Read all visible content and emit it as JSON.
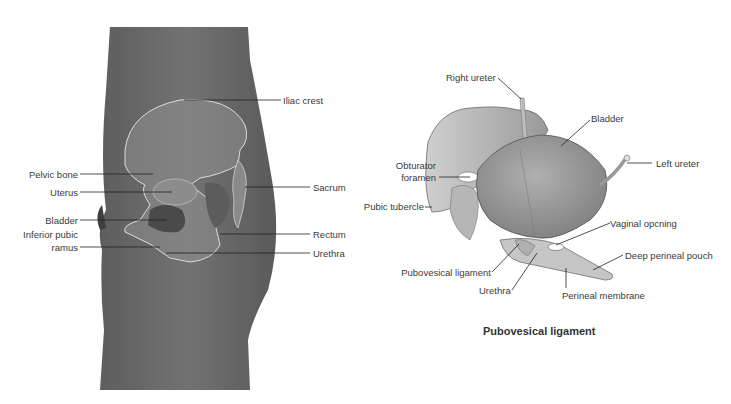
{
  "left_figure": {
    "labels": {
      "iliac_crest": "Iliac crest",
      "pelvic_bone": "Pelvic bone",
      "uterus": "Uterus",
      "sacrum": "Sacrum",
      "bladder": "Bladder",
      "inferior_pubic_ramus_1": "Inferior pubic",
      "inferior_pubic_ramus_2": "ramus",
      "rectum": "Rectum",
      "urethra": "Urethra"
    },
    "colors": {
      "body": "#6e6e6e",
      "bone_outline": "#d8d8d8",
      "bladder": "#4a4a4a"
    }
  },
  "right_figure": {
    "labels": {
      "right_ureter": "Right ureter",
      "bladder": "Bladder",
      "left_ureter": "Left ureter",
      "obturator_foramen_1": "Obturator",
      "obturator_foramen_2": "foramen",
      "pubic_tubercle": "Pubic tubercle",
      "vaginal_opening": "Vaginal opcning",
      "deep_perineal_pouch": "Deep perineal pouch",
      "pubovesical_ligament": "Pubovesical ligament",
      "urethra": "Urethra",
      "perineal_membrane": "Perineal membrane"
    },
    "caption": "Pubovesical ligament",
    "colors": {
      "bladder": "#9a9a9a",
      "bone": "#b8b8b8",
      "membrane": "#c4c4c4"
    }
  }
}
